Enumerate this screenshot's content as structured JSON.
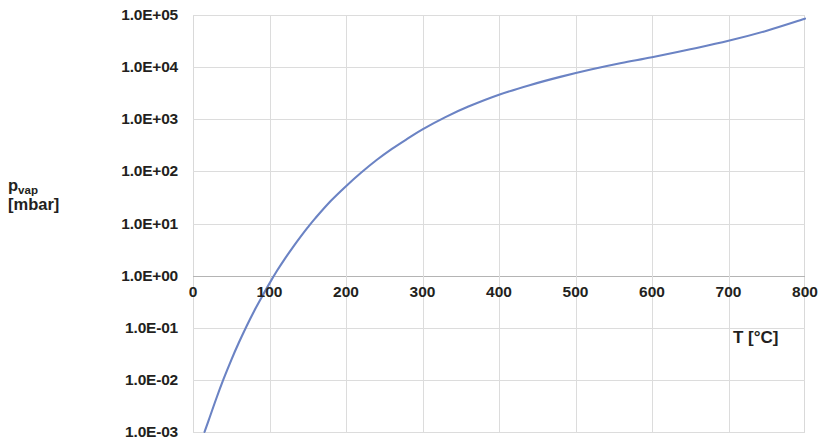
{
  "chart_data": {
    "type": "line",
    "title": "",
    "subtitle": "",
    "xlabel": "T [°C]",
    "ylabel_line1": "p",
    "ylabel_sub": "vap",
    "ylabel_line2": "[mbar]",
    "ylabel": "p_vap [mbar]",
    "xscale": "linear",
    "yscale": "log",
    "xlim": [
      0,
      800
    ],
    "ylim": [
      0.001,
      100000
    ],
    "grid": true,
    "legend": "none",
    "line_color": "#6b83c4",
    "line_width": 2,
    "xticks": [
      0,
      100,
      200,
      300,
      400,
      500,
      600,
      700,
      800
    ],
    "xtick_labels": [
      "0",
      "100",
      "200",
      "300",
      "400",
      "500",
      "600",
      "700",
      "800"
    ],
    "yticks": [
      100000,
      10000,
      1000,
      100,
      10,
      1,
      0.1,
      0.01,
      0.001
    ],
    "ytick_labels": [
      "1.0E+05",
      "1.0E+04",
      "1.0E+03",
      "1.0E+02",
      "1.0E+01",
      "1.0E+00",
      "1.0E-01",
      "1.0E-02",
      "1.0E-03"
    ],
    "series": [
      {
        "name": "vapour pressure",
        "x": [
          15,
          20,
          30,
          40,
          50,
          60,
          70,
          80,
          90,
          100,
          110,
          120,
          130,
          140,
          150,
          160,
          180,
          200,
          220,
          240,
          260,
          280,
          300,
          330,
          360,
          400,
          440,
          480,
          520,
          560,
          600,
          650,
          700,
          750,
          800
        ],
        "y": [
          0.001,
          0.0016,
          0.0042,
          0.0104,
          0.024,
          0.052,
          0.107,
          0.21,
          0.39,
          0.71,
          1.25,
          2.1,
          3.4,
          5.4,
          8.4,
          12.7,
          27,
          52,
          95,
          165,
          270,
          420,
          640,
          1100,
          1750,
          2950,
          4500,
          6500,
          9000,
          12000,
          15500,
          22000,
          32000,
          50000,
          85000
        ]
      }
    ],
    "annotations": []
  },
  "axis": {
    "y_title_primary": "p",
    "y_title_subscript": "vap",
    "y_title_units": "[mbar]",
    "x_title": "T [°C]"
  }
}
